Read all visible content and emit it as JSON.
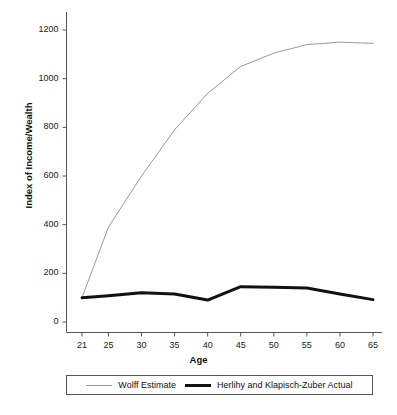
{
  "chart_data": {
    "type": "line",
    "title": "",
    "subtitle": "",
    "xlabel": "Age",
    "ylabel": "Index of Income/Wealth",
    "xlim": [
      19,
      67
    ],
    "ylim": [
      0,
      1240
    ],
    "grid": false,
    "legend_position": "bottom",
    "xticks": [
      "21",
      "25",
      "30",
      "35",
      "40",
      "45",
      "50",
      "55",
      "60",
      "65"
    ],
    "xtick_values": [
      21,
      25,
      30,
      35,
      40,
      45,
      50,
      55,
      60,
      65
    ],
    "yticks": [
      "0",
      "200",
      "400",
      "600",
      "800",
      "1000",
      "1200"
    ],
    "ytick_values": [
      0,
      200,
      400,
      600,
      800,
      1000,
      1200
    ],
    "x": [
      21,
      25,
      30,
      35,
      40,
      45,
      50,
      55,
      60,
      65
    ],
    "series": [
      {
        "name": "Wolff Estimate",
        "color": "#9a9a9a",
        "width": 1,
        "values": [
          100,
          390,
          600,
          790,
          940,
          1050,
          1105,
          1140,
          1150,
          1145
        ]
      },
      {
        "name": "Herlihy and Klapisch-Zuber Actual",
        "color": "#111111",
        "width": 3,
        "values": [
          100,
          108,
          120,
          115,
          90,
          145,
          143,
          140,
          115,
          92
        ]
      }
    ]
  },
  "axes": {
    "y_axis_title": "Index of Income/Wealth",
    "x_axis_title": "Age"
  },
  "legend": {
    "entries": [
      {
        "label": "Wolff Estimate",
        "swatch": "thin-gray-line"
      },
      {
        "label": "Herlihy and Klapisch-Zuber Actual",
        "swatch": "thick-black-line"
      }
    ]
  }
}
